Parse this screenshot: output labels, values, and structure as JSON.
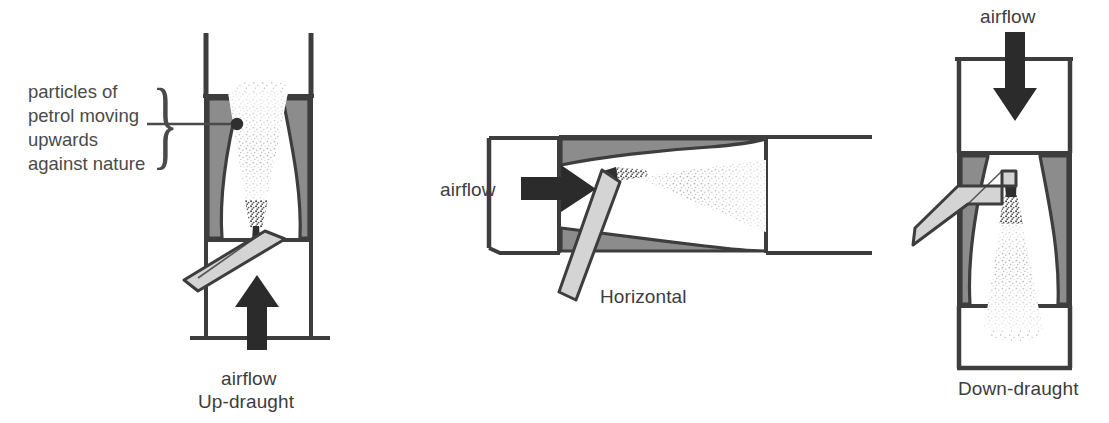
{
  "figure": {
    "title_present": false,
    "background_color": "#ffffff",
    "ink_color": "#3d3d3d",
    "venturi_fill": "#8c8c8c",
    "throttle_fill": "#d4d4d4",
    "spray_color": "#9a9a9a",
    "arrow_color": "#2b2b2b"
  },
  "callout": {
    "lines": [
      "particles of",
      "petrol moving",
      "upwards",
      "against nature"
    ],
    "brace_glyph": "}",
    "pointer_dot": "jet-outlet-point"
  },
  "diagrams": [
    {
      "id": "up-draught",
      "name": "Up-draught carburettor",
      "caption": "Up-draught",
      "airflow_label": "airflow",
      "airflow_direction": "up",
      "arrow_icon": "arrow-up-icon",
      "spray_direction": "upwards",
      "orientation": "vertical"
    },
    {
      "id": "horizontal",
      "name": "Horizontal carburettor",
      "caption": "Horizontal",
      "airflow_label": "airflow",
      "airflow_direction": "right",
      "arrow_icon": "arrow-right-icon",
      "spray_direction": "sideways",
      "orientation": "horizontal"
    },
    {
      "id": "down-draught",
      "name": "Down-draught carburettor",
      "caption": "Down-draught",
      "airflow_label": "airflow",
      "airflow_direction": "down",
      "arrow_icon": "arrow-down-icon",
      "spray_direction": "downwards",
      "orientation": "vertical"
    }
  ]
}
